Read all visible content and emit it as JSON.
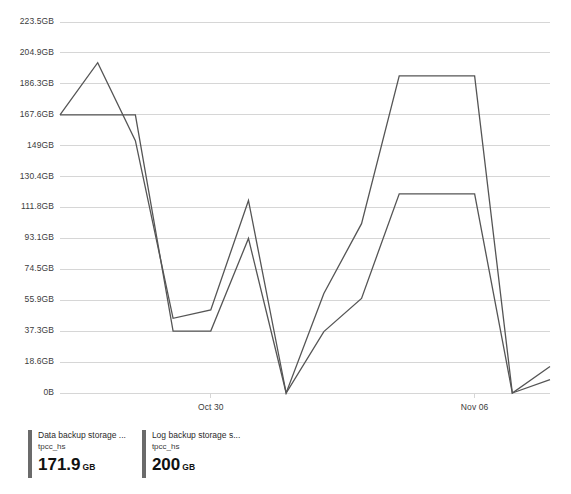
{
  "chart_data": {
    "type": "line",
    "title": "",
    "xlabel": "",
    "ylabel": "",
    "ylim": [
      0,
      223.5
    ],
    "y_unit": "GB",
    "grid": true,
    "legend_position": "bottom-left",
    "y_ticks": [
      "0B",
      "18.6GB",
      "37.3GB",
      "55.9GB",
      "74.5GB",
      "93.1GB",
      "111.8GB",
      "130.4GB",
      "149GB",
      "167.6GB",
      "186.3GB",
      "204.9GB",
      "223.5GB"
    ],
    "y_tick_values": [
      0,
      18.6,
      37.3,
      55.9,
      74.5,
      93.1,
      111.8,
      130.4,
      149,
      167.6,
      186.3,
      204.9,
      223.5
    ],
    "x_ticks": [
      "Oct 30",
      "Nov 06"
    ],
    "x_tick_indices": [
      4,
      11
    ],
    "x": [
      0,
      1,
      2,
      3,
      4,
      5,
      6,
      7,
      8,
      9,
      10,
      11,
      12,
      13
    ],
    "series": [
      {
        "name": "Log backup storage s...",
        "resource": "tpcc_hs",
        "current_value": "200",
        "current_unit": "GB",
        "color": "#555555",
        "values": [
          167.6,
          199.0,
          152.0,
          45.0,
          50.0,
          116.0,
          0.0,
          60.0,
          102.0,
          191.0,
          191.0,
          191.0,
          0.0,
          16.0
        ]
      },
      {
        "name": "Data backup storage ...",
        "resource": "tpcc_hs",
        "current_value": "171.9",
        "current_unit": "GB",
        "color": "#555555",
        "values": [
          167.6,
          167.6,
          167.6,
          37.3,
          37.3,
          93.1,
          0.0,
          37.0,
          57.0,
          120.0,
          120.0,
          120.0,
          0.0,
          8.0
        ]
      }
    ]
  },
  "legend": {
    "items": [
      {
        "title": "Data backup storage ...",
        "subtitle": "tpcc_hs",
        "value": "171.9",
        "unit": "GB"
      },
      {
        "title": "Log backup storage s...",
        "subtitle": "tpcc_hs",
        "value": "200",
        "unit": "GB"
      }
    ]
  },
  "colors": {
    "line": "#555555",
    "grid": "#d6d6d6",
    "text": "#3c3c3c",
    "swatch": "#6b6b6b",
    "background": "#ffffff"
  }
}
